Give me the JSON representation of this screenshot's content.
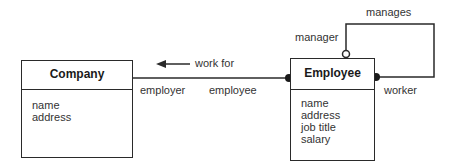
{
  "classes": {
    "company": {
      "name": "Company",
      "attributes": [
        "name",
        "address"
      ]
    },
    "employee": {
      "name": "Employee",
      "attributes": [
        "name",
        "address",
        "job title",
        "salary"
      ]
    }
  },
  "associations": {
    "works_for": {
      "name": "work for",
      "direction_arrow": "left-arrow-icon",
      "role_company": "employer",
      "role_employee": "employee"
    },
    "manages": {
      "name": "manages",
      "role_manager": "manager",
      "role_worker": "worker"
    }
  }
}
